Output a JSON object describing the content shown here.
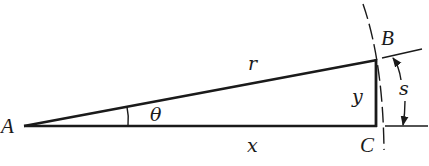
{
  "figure": {
    "type": "geometry",
    "colors": {
      "ink": "#1a1a1a",
      "background": "#ffffff"
    }
  },
  "points": {
    "A": {
      "label": "A",
      "x": 24,
      "y": 126
    },
    "B": {
      "label": "B",
      "x": 376,
      "y": 60
    },
    "C": {
      "label": "C",
      "x": 376,
      "y": 126
    }
  },
  "segments": {
    "hypotenuse": {
      "label": "r",
      "from": "A",
      "to": "B"
    },
    "adjacent": {
      "label": "x",
      "from": "A",
      "to": "C"
    },
    "opposite": {
      "label": "y",
      "from": "B",
      "to": "C"
    }
  },
  "angle": {
    "label": "θ",
    "vertex": "A"
  },
  "arc": {
    "label": "s",
    "style": "dashed",
    "dimension": "arc length from C to B"
  },
  "labels": {
    "A": "A",
    "B": "B",
    "C": "C",
    "r": "r",
    "x": "x",
    "y": "y",
    "s": "s",
    "theta": "θ"
  }
}
